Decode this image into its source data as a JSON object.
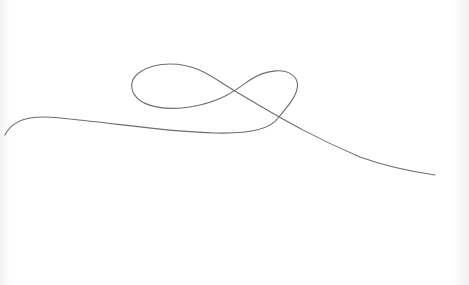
{
  "canvas": {
    "width": 469,
    "height": 285,
    "background": "#ffffff",
    "stroke_color": "#6e6e6e",
    "stroke_width": 1.1
  },
  "drawing": {
    "description": "single continuous hand-drawn line with a figure-eight loop",
    "path": "M 5 135 C 15 115, 40 115, 70 119 C 120 124, 170 132, 215 133 C 255 134, 272 127, 278 118 C 290 104, 302 90, 296 79 C 288 66, 265 70, 250 80 C 238 88, 228 98, 200 105 C 170 112, 140 108, 133 92 C 126 74, 150 64, 170 64 C 200 64, 215 80, 240 94 C 290 124, 320 140, 360 157 C 390 168, 415 172, 435 175"
  }
}
